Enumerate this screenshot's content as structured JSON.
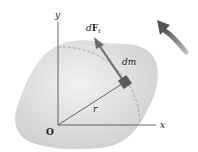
{
  "diagram": {
    "labels": {
      "y_axis": "y",
      "x_axis": "x",
      "origin": "O",
      "radius": "r",
      "mass_element": "dm",
      "force_d": "d",
      "force_F": "F",
      "force_sub": "t"
    },
    "colors": {
      "body_fill": "#d9d9d9",
      "axis": "#555555",
      "force_arrow": "#6e6e6e",
      "mass_block": "#5a5a5a",
      "rotation_arrow": "#666666",
      "dashed_arc": "#9a9a9a"
    }
  }
}
